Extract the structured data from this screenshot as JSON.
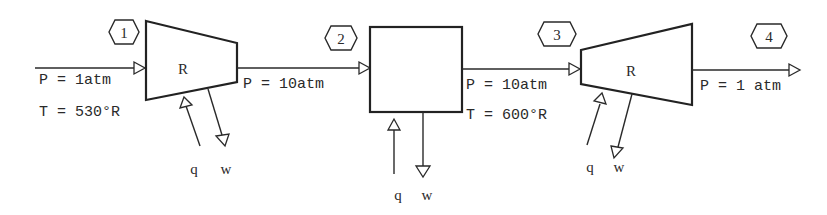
{
  "diagram": {
    "type": "process-flow",
    "states": [
      {
        "id": "1",
        "label": "1",
        "pressure": "P = 1atm",
        "temperature": "T = 530°R"
      },
      {
        "id": "2",
        "label": "2",
        "pressure": "P = 10atm"
      },
      {
        "id": "3",
        "label": "3",
        "pressure": "P = 10atm",
        "temperature": "T = 600°R"
      },
      {
        "id": "4",
        "label": "4",
        "pressure": "P = 1 atm"
      }
    ],
    "components": [
      {
        "id": "compressor",
        "shape": "trapezoid-converging",
        "label": "R",
        "heat": "q",
        "work": "w"
      },
      {
        "id": "heater",
        "shape": "box",
        "label": "",
        "heat": "q",
        "work": "w"
      },
      {
        "id": "turbine",
        "shape": "trapezoid-diverging",
        "label": "R",
        "heat": "q",
        "work": "w"
      }
    ]
  }
}
